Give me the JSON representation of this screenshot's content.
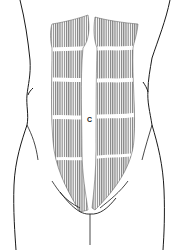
{
  "figure": {
    "type": "anatomical-illustration",
    "label": "C",
    "colors": {
      "outline": "#1a1a1a",
      "muscle_fiber": "#6e6e6e",
      "background": "#ffffff"
    },
    "parts": [
      "torso-outline-left",
      "torso-outline-right",
      "rectus-abdominis-left",
      "rectus-abdominis-right",
      "tendinous-intersections",
      "pubic-line",
      "midline-gap"
    ]
  }
}
